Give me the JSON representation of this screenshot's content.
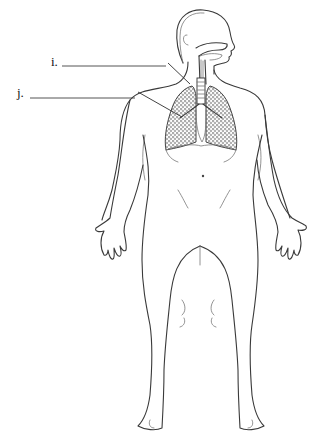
{
  "figure": {
    "type": "diagram",
    "labels": [
      {
        "id": "i",
        "text": "i.",
        "blank_line": true,
        "points_to": "trachea"
      },
      {
        "id": "j",
        "text": "j.",
        "blank_line": true,
        "points_to": "lung / bronchus"
      }
    ],
    "colors": {
      "background": "#ffffff",
      "line": "#3a3a3a",
      "lung_texture": "#555555"
    }
  }
}
